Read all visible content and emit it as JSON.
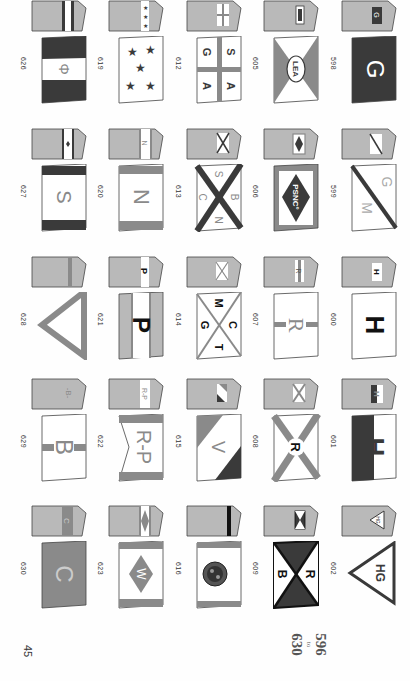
{
  "page": {
    "page_number": "45",
    "range": {
      "from": "596",
      "to_label": "to",
      "to": "630"
    },
    "orientation": "rotated 90 degrees clockwise"
  },
  "colors": {
    "funnel_grey": "#b9b9b9",
    "accent_mid": "#8a8a8a",
    "dark": "#3a3a3a",
    "white": "#ffffff",
    "outline": "#444444"
  },
  "grid": {
    "columns": 5,
    "rows": 5,
    "cells": [
      {
        "number": "626",
        "flag_text": "Φ",
        "description": "dark-white-dark horizontal bands with phi symbol"
      },
      {
        "number": "619",
        "flag_text": "",
        "description": "white flag with five dark stars"
      },
      {
        "number": "612",
        "flag_text": "S A G A",
        "description": "grey cross quartering white with letters S, A, G, A"
      },
      {
        "number": "605",
        "flag_text": "LEA",
        "description": "saltire-divided grey/white with LEA oval"
      },
      {
        "number": "598",
        "flag_text": "G",
        "description": "dark flag with white G"
      },
      {
        "number": "627",
        "flag_text": "S",
        "description": "white with dark borders, grey S"
      },
      {
        "number": "620",
        "flag_text": "N",
        "description": "white with grey borders, grey N"
      },
      {
        "number": "613",
        "flag_text": "S B C N",
        "description": "dark saltire on white with letters S, B, C, N"
      },
      {
        "number": "606",
        "flag_text": "PSNC°",
        "description": "grey border, white field, dark diamond with PSNC°"
      },
      {
        "number": "599",
        "flag_text": "G M",
        "description": "white divided diagonally by dark line with G and M"
      },
      {
        "number": "628",
        "flag_text": "",
        "description": "grey V-shaped pennant outline"
      },
      {
        "number": "621",
        "flag_text": "P",
        "description": "grey with white central band and dark P"
      },
      {
        "number": "614",
        "flag_text": "M C G T",
        "description": "grey saltire on white with letters M, C, G, T"
      },
      {
        "number": "607",
        "flag_text": "R",
        "description": "white with grey vertical bar and grey R"
      },
      {
        "number": "600",
        "flag_text": "H",
        "description": "white flag with dark H"
      },
      {
        "number": "629",
        "flag_text": "B",
        "description": "white with grey band and grey B"
      },
      {
        "number": "622",
        "flag_text": "R-P",
        "description": "swallowtail white with grey borders, R-P"
      },
      {
        "number": "615",
        "flag_text": "V",
        "description": "diagonal grey/white/dark with V"
      },
      {
        "number": "608",
        "flag_text": "R",
        "description": "white with grey saltire and dark R"
      },
      {
        "number": "601",
        "flag_text": "H",
        "description": "white over dark with H"
      },
      {
        "number": "630",
        "flag_text": "C",
        "description": "grey flag with light C"
      },
      {
        "number": "623",
        "flag_text": "W",
        "description": "white with grey borders, grey diamond with W"
      },
      {
        "number": "616",
        "flag_text": "",
        "description": "white with grey border, round dark emblem"
      },
      {
        "number": "609",
        "flag_text": "R B",
        "description": "saltire-divided dark/white with R and B"
      },
      {
        "number": "602",
        "flag_text": "HG",
        "description": "triangular pennant with HG"
      }
    ]
  }
}
